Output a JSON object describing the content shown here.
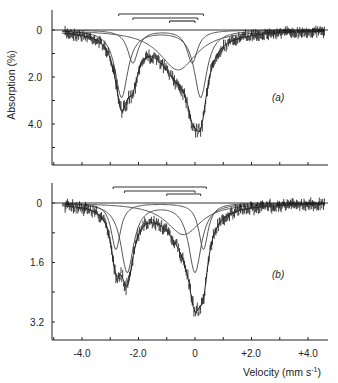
{
  "chart_data": [
    {
      "type": "line",
      "panel": "(a)",
      "xlabel": "Velocity (mm s-1)",
      "ylabel": "Absorption (%)",
      "xlim": [
        -5.0,
        4.7
      ],
      "ylim": [
        5.8,
        -0.8
      ],
      "yticks": [
        "0",
        "2.0",
        "4.0"
      ],
      "grid": false,
      "baseline": 0,
      "components": [
        {
          "name": "doublet-1",
          "peaks": [
            {
              "x": -2.6,
              "depth": 2.85,
              "width": 0.55
            },
            {
              "x": 0.2,
              "depth": 2.85,
              "width": 0.55
            }
          ]
        },
        {
          "name": "doublet-2",
          "peaks": [
            {
              "x": -2.2,
              "depth": 1.4,
              "width": 0.45
            },
            {
              "x": -0.1,
              "depth": 1.4,
              "width": 0.45
            }
          ]
        },
        {
          "name": "broad-component",
          "peaks": [
            {
              "x": -0.6,
              "depth": 1.7,
              "width": 1.6
            }
          ]
        }
      ],
      "envelope_minima": [
        {
          "x": -2.6,
          "y": 4.0
        },
        {
          "x": 0.1,
          "y": 5.4
        }
      ],
      "stick_bars": [
        {
          "from": -2.7,
          "to": 0.3
        },
        {
          "from": -2.2,
          "to": 0.1
        },
        {
          "from": -0.9,
          "to": 0.0
        }
      ]
    },
    {
      "type": "line",
      "panel": "(b)",
      "xlabel": "Velocity (mm s-1)",
      "ylabel": "Absorption (%)",
      "xlim": [
        -5.0,
        4.7
      ],
      "ylim": [
        3.7,
        -0.5
      ],
      "xticks": [
        "-4.0",
        "-2.0",
        "0",
        "+2.0",
        "+4.0"
      ],
      "yticks": [
        "0",
        "1.6",
        "3.2"
      ],
      "grid": false,
      "baseline": 0,
      "components": [
        {
          "name": "doublet-1",
          "peaks": [
            {
              "x": -2.8,
              "depth": 1.25,
              "width": 0.4
            },
            {
              "x": 0.3,
              "depth": 1.25,
              "width": 0.4
            }
          ]
        },
        {
          "name": "doublet-2",
          "peaks": [
            {
              "x": -2.4,
              "depth": 1.85,
              "width": 0.55
            },
            {
              "x": 0.0,
              "depth": 1.85,
              "width": 0.55
            }
          ]
        },
        {
          "name": "broad-component",
          "peaks": [
            {
              "x": -0.4,
              "depth": 0.85,
              "width": 1.5
            }
          ]
        }
      ],
      "envelope_minima": [
        {
          "x": -2.5,
          "y": 2.6
        },
        {
          "x": 0.1,
          "y": 3.3
        }
      ],
      "stick_bars": [
        {
          "from": -2.9,
          "to": 0.4
        },
        {
          "from": -2.5,
          "to": 0.0
        },
        {
          "from": -1.0,
          "to": 0.2
        }
      ]
    }
  ],
  "labels": {
    "ylabel": "Absorption (%)",
    "xlabel": "Velocity (mm s",
    "xlabel_sup": "-1",
    "xlabel_close": ")",
    "panel_a": "(a)",
    "panel_b": "(b)",
    "top_yticks": [
      "0",
      "2.0",
      "4.0"
    ],
    "bottom_yticks": [
      "0",
      "1.6",
      "3.2"
    ],
    "xticks": [
      "-4.0",
      "-2.0",
      "0",
      "+2.0",
      "+4.0"
    ]
  },
  "colors": {
    "axis": "#222222",
    "data": "#1a1a1a",
    "fit": "#333333",
    "background": "#ffffff"
  }
}
